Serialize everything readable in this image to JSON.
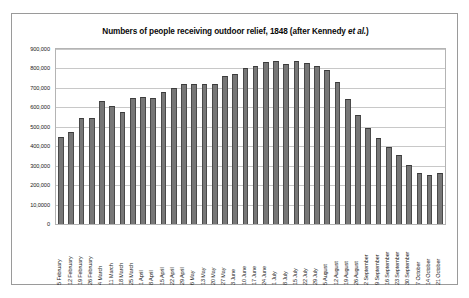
{
  "chart_data": {
    "type": "bar",
    "title": "Numbers of people receiving outdoor relief, 1848 (after Kennedy et al.)",
    "title_plain": "Numbers of people receiving outdoor relief, 1848 (after Kennedy ",
    "title_italic": "et al.",
    "title_tail": ")",
    "xlabel": "",
    "ylabel": "",
    "ylim": [
      0,
      900000
    ],
    "grid": true,
    "legend": "none",
    "ytick_labels": [
      "900,000",
      "800,000",
      "700,000",
      "600,000",
      "500,000",
      "400,000",
      "300,000",
      "200,000",
      "10,0000",
      "0"
    ],
    "ytick_values": [
      900000,
      800000,
      700000,
      600000,
      500000,
      400000,
      300000,
      200000,
      100000,
      0
    ],
    "categories": [
      "5 February",
      "12 February",
      "19 February",
      "26 February",
      "4 March",
      "11 March",
      "18 March",
      "25 March",
      "1 April",
      "8 April",
      "15 April",
      "22 April",
      "29 April",
      "6 May",
      "13 May",
      "20 May",
      "27 May",
      "3 June",
      "10 June",
      "17 June",
      "24 June",
      "1 July",
      "8 July",
      "15 July",
      "22 July",
      "29 July",
      "5 August",
      "12 August",
      "19 August",
      "26 August",
      "2 September",
      "9 September",
      "16 September",
      "23 September",
      "30 September",
      "7 October",
      "14 October",
      "21 October"
    ],
    "values": [
      449000,
      472000,
      545000,
      545000,
      635000,
      605000,
      575000,
      650000,
      652000,
      648000,
      678000,
      700000,
      722000,
      722000,
      722000,
      722000,
      760000,
      772000,
      800000,
      812000,
      832000,
      838000,
      822000,
      838000,
      828000,
      812000,
      792000,
      732000,
      645000,
      560000,
      495000,
      440000,
      398000,
      355000,
      302000,
      262000,
      250000,
      262000
    ]
  }
}
